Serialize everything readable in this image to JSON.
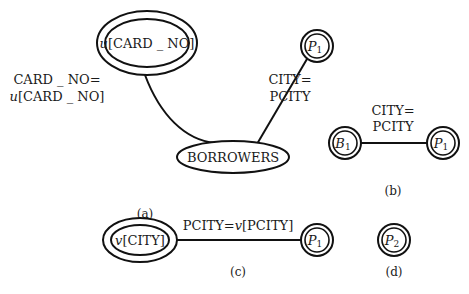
{
  "colors": {
    "stroke": "#111111",
    "text": "#1a1a1a",
    "background": "#ffffff"
  },
  "panel_a": {
    "caption": "(a)",
    "node_u": {
      "var": "u",
      "attr": "[CARD _ NO]"
    },
    "node_borrowers": {
      "label": "BORROWERS"
    },
    "node_p1": {
      "var": "P",
      "sub": "1"
    },
    "edge_u_borrowers": {
      "line1": "CARD _ NO=",
      "line2_var": "u",
      "line2_attr": "[CARD _ NO]"
    },
    "edge_borrowers_p1": {
      "line1": "CITY=",
      "line2": "PCITY"
    }
  },
  "panel_b": {
    "caption": "(b)",
    "node_b1": {
      "var": "B",
      "sub": "1"
    },
    "node_p1": {
      "var": "P",
      "sub": "1"
    },
    "edge": {
      "line1": "CITY=",
      "line2": "PCITY"
    }
  },
  "panel_c": {
    "caption": "(c)",
    "node_v": {
      "var": "v",
      "attr": "[CITY]"
    },
    "node_p1": {
      "var": "P",
      "sub": "1"
    },
    "edge": {
      "pre": "PCITY=",
      "var": "v",
      "attr": "[PCITY]"
    }
  },
  "panel_d": {
    "caption": "(d)",
    "node_p2": {
      "var": "P",
      "sub": "2"
    }
  }
}
